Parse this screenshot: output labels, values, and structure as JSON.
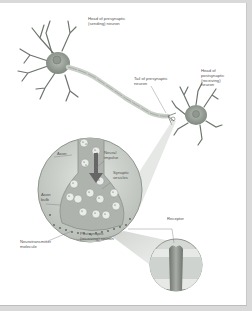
{
  "diagram": {
    "labels": {
      "presynaptic_head": "Head of presynaptic\n(sending) neuron",
      "presynaptic_tail": "Tail of presynaptic\nneuron",
      "postsynaptic_head": "Head of\npostsynaptic\n(receiving)\nneuron",
      "axon": "Axon",
      "neural_impulse": "Neural\nimpulse",
      "synaptic_vesicles": "Synaptic\nvesicles",
      "axon_bulb": "Axon\nbulb",
      "postsynaptic_neuron": "Postsynaptic\n(receiving) neuron",
      "neurotransmitter": "Neurotransmitter\nmolecule",
      "receptor": "Receptor"
    },
    "colors": {
      "neuron_body": "#9aa39a",
      "axon_fill": "#d7dcd6",
      "magnifier_bg": "#cfd3cf",
      "cleft": "#b8bdb8",
      "vesicle": "#eef0ee",
      "arrow": "#666666",
      "receptor": "#8d918d"
    }
  }
}
